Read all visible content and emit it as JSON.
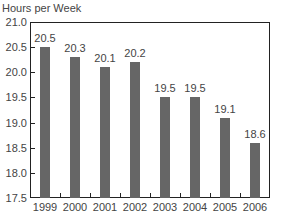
{
  "chart_data": {
    "type": "bar",
    "title": "",
    "xlabel": "",
    "ylabel": "Hours per Week",
    "categories": [
      "1999",
      "2000",
      "2001",
      "2002",
      "2003",
      "2004",
      "2005",
      "2006"
    ],
    "values": [
      20.5,
      20.3,
      20.1,
      20.2,
      19.5,
      19.5,
      19.1,
      18.6
    ],
    "value_labels": [
      "20.5",
      "20.3",
      "20.1",
      "20.2",
      "19.5",
      "19.5",
      "19.1",
      "18.6"
    ],
    "ylim": [
      17.5,
      21.0
    ],
    "yticks": [
      "21.0",
      "20.5",
      "20.0",
      "19.5",
      "19.0",
      "18.5",
      "18.0",
      "17.5"
    ],
    "grid": false,
    "legend": null,
    "bar_color": "#666666"
  }
}
